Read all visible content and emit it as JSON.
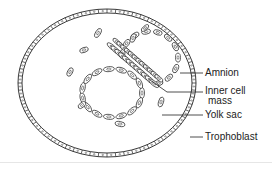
{
  "figure": {
    "labels": {
      "amnion": "Amnion",
      "inner_cell_mass_line1": "Inner cell",
      "inner_cell_mass_line2": "mass",
      "yolk_sac": "Yolk sac",
      "trophoblast": "Trophoblast"
    },
    "colors": {
      "ink": "#222222",
      "background": "#ffffff"
    }
  }
}
